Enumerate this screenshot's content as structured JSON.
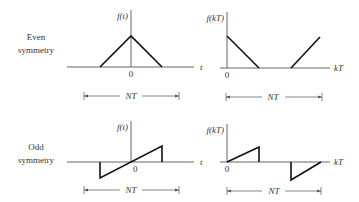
{
  "rows": [
    {
      "label_line1": "Even",
      "label_line2": "symmetry",
      "continuous": {
        "y_label": "f(t)",
        "x_label": "t",
        "origin_label": "0",
        "span_label": "NT",
        "shape": "triangle centered at origin"
      },
      "discrete": {
        "y_label": "f(kT)",
        "x_label": "kT",
        "origin_label": "0",
        "span_label": "NT",
        "shape": "descending ramp at start, ascending ramp at end"
      }
    },
    {
      "label_line1": "Odd",
      "label_line2": "symmetry",
      "continuous": {
        "y_label": "f(t)",
        "x_label": "t",
        "origin_label": "0",
        "span_label": "NT",
        "shape": "sawtooth through origin"
      },
      "discrete": {
        "y_label": "f(kT)",
        "x_label": "kT",
        "origin_label": "0",
        "span_label": "NT",
        "shape": "positive ramp at start, negative ramp at end"
      }
    }
  ]
}
